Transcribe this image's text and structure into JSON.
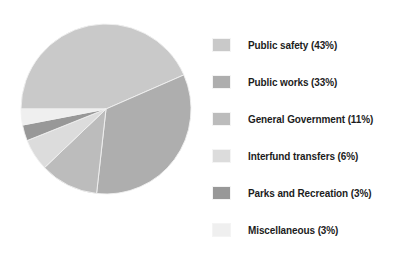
{
  "chart_data": {
    "type": "pie",
    "title": "",
    "subtitle": "",
    "xlabel": "",
    "ylabel": "",
    "legend_position": "right",
    "grid": false,
    "unit": "%",
    "categories": [
      "Public safety",
      "Public works",
      "General Government",
      "Interfund transfers",
      "Parks and Recreation",
      "Miscellaneous"
    ],
    "values": [
      43,
      33,
      11,
      6,
      3,
      3
    ],
    "total": 99,
    "colors": [
      "#c9c9c9",
      "#aeaeae",
      "#bcbcbc",
      "#dcdcdc",
      "#989898",
      "#efefef"
    ],
    "slices": [
      {
        "label": "Public safety",
        "value": 43,
        "display": "Public safety (43%)",
        "color": "#c9c9c9"
      },
      {
        "label": "Public works",
        "value": 33,
        "display": "Public works (33%)",
        "color": "#aeaeae"
      },
      {
        "label": "General Government",
        "value": 11,
        "display": "General Government (11%)",
        "color": "#bcbcbc"
      },
      {
        "label": "Interfund transfers",
        "value": 6,
        "display": "Interfund transfers (6%)",
        "color": "#dcdcdc"
      },
      {
        "label": "Parks and Recreation",
        "value": 3,
        "display": "Parks and Recreation (3%)",
        "color": "#989898"
      },
      {
        "label": "Miscellaneous",
        "value": 3,
        "display": "Miscellaneous (3%)",
        "color": "#efefef"
      }
    ]
  },
  "legend": {
    "items": [
      {
        "text": "Public safety (43%)",
        "color": "#c9c9c9"
      },
      {
        "text": "Public works (33%)",
        "color": "#aeaeae"
      },
      {
        "text": "General Government (11%)",
        "color": "#bcbcbc"
      },
      {
        "text": "Interfund transfers (6%)",
        "color": "#dcdcdc"
      },
      {
        "text": "Parks and Recreation (3%)",
        "color": "#989898"
      },
      {
        "text": "Miscellaneous (3%)",
        "color": "#efefef"
      }
    ]
  },
  "style": {
    "background": "#ffffff",
    "text_color": "#1c1c1c",
    "slice_stroke": "#f0f0f0"
  }
}
